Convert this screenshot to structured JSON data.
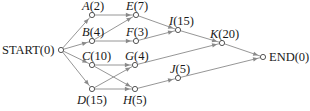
{
  "diagram": {
    "type": "activity-network",
    "nodes": [
      {
        "id": "START",
        "label": "START",
        "duration": "0",
        "x": 61,
        "y": 50,
        "lx": 2,
        "ly": 54,
        "anchor": "start",
        "italic": false
      },
      {
        "id": "A",
        "label": "A",
        "duration": "2",
        "x": 92,
        "y": 15,
        "lx": 82,
        "ly": 10,
        "anchor": "start",
        "italic": true
      },
      {
        "id": "B",
        "label": "B",
        "duration": "4",
        "x": 92,
        "y": 41,
        "lx": 82,
        "ly": 36,
        "anchor": "start",
        "italic": true
      },
      {
        "id": "C",
        "label": "C",
        "duration": "10",
        "x": 92,
        "y": 65,
        "lx": 82,
        "ly": 60,
        "anchor": "start",
        "italic": true
      },
      {
        "id": "D",
        "label": "D",
        "duration": "15",
        "x": 92,
        "y": 89,
        "lx": 77,
        "ly": 104,
        "anchor": "start",
        "italic": true
      },
      {
        "id": "E",
        "label": "E",
        "duration": "7",
        "x": 136,
        "y": 15,
        "lx": 126,
        "ly": 10,
        "anchor": "start",
        "italic": true
      },
      {
        "id": "F",
        "label": "F",
        "duration": "3",
        "x": 136,
        "y": 41,
        "lx": 126,
        "ly": 36,
        "anchor": "start",
        "italic": true
      },
      {
        "id": "G",
        "label": "G",
        "duration": "4",
        "x": 135,
        "y": 65,
        "lx": 125,
        "ly": 60,
        "anchor": "start",
        "italic": true
      },
      {
        "id": "H",
        "label": "H",
        "duration": "5",
        "x": 135,
        "y": 89,
        "lx": 123,
        "ly": 104,
        "anchor": "start",
        "italic": true
      },
      {
        "id": "I",
        "label": "I",
        "duration": "15",
        "x": 178,
        "y": 30,
        "lx": 169,
        "ly": 25,
        "anchor": "start",
        "italic": true
      },
      {
        "id": "J",
        "label": "J",
        "duration": "5",
        "x": 178,
        "y": 78,
        "lx": 170,
        "ly": 73,
        "anchor": "start",
        "italic": true
      },
      {
        "id": "K",
        "label": "K",
        "duration": "20",
        "x": 222,
        "y": 43,
        "lx": 210,
        "ly": 38,
        "anchor": "start",
        "italic": true
      },
      {
        "id": "END",
        "label": "END",
        "duration": "0",
        "x": 263,
        "y": 57,
        "lx": 269,
        "ly": 61,
        "anchor": "start",
        "italic": false
      }
    ],
    "edges": [
      [
        "START",
        "A"
      ],
      [
        "START",
        "B"
      ],
      [
        "START",
        "C"
      ],
      [
        "START",
        "D"
      ],
      [
        "A",
        "E"
      ],
      [
        "B",
        "E"
      ],
      [
        "B",
        "F"
      ],
      [
        "C",
        "G"
      ],
      [
        "C",
        "H"
      ],
      [
        "D",
        "G"
      ],
      [
        "D",
        "H"
      ],
      [
        "E",
        "I"
      ],
      [
        "F",
        "I"
      ],
      [
        "G",
        "K"
      ],
      [
        "I",
        "K"
      ],
      [
        "H",
        "J"
      ],
      [
        "K",
        "END"
      ],
      [
        "J",
        "END"
      ]
    ],
    "colors": {
      "edge": "#8a8a8a",
      "node_stroke": "#444444",
      "text": "#1a1a1a"
    }
  }
}
